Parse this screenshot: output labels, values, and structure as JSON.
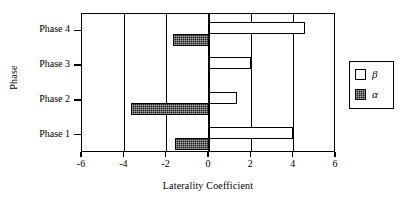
{
  "chart_data": {
    "type": "bar",
    "orientation": "horizontal",
    "title": "",
    "xlabel": "Laterality Coefficient",
    "ylabel": "Phase",
    "categories": [
      "Phase 1",
      "Phase 2",
      "Phase 3",
      "Phase 4"
    ],
    "series": [
      {
        "name": "β",
        "key": "beta",
        "values": [
          3.95,
          1.3,
          2.0,
          4.55
        ],
        "fill": "#ffffff",
        "edge": "#000000"
      },
      {
        "name": "α",
        "key": "alpha",
        "values": [
          -1.6,
          -3.7,
          -0.05,
          -1.7
        ],
        "fill": "#1b1b1b",
        "edge": "#000000"
      }
    ],
    "xlim": [
      -6,
      6
    ],
    "xticks": [
      -6,
      -4,
      -2,
      0,
      2,
      4,
      6
    ],
    "xticklabels": [
      "-6",
      "-4",
      "-2",
      "0",
      "2",
      "4",
      "6"
    ],
    "grid": "vertical-major",
    "legend": {
      "position": "right-outside",
      "entries": [
        "β",
        "α"
      ]
    },
    "frame": true,
    "colors": {
      "axis": "#000000",
      "background": "#ffffff",
      "beta_fill": "#ffffff",
      "alpha_fill": "#1b1b1b"
    }
  },
  "axis": {
    "x_title": "Laterality Coefficient",
    "y_title": "Phase"
  },
  "legend": {
    "beta_label": "β",
    "alpha_label": "α"
  }
}
